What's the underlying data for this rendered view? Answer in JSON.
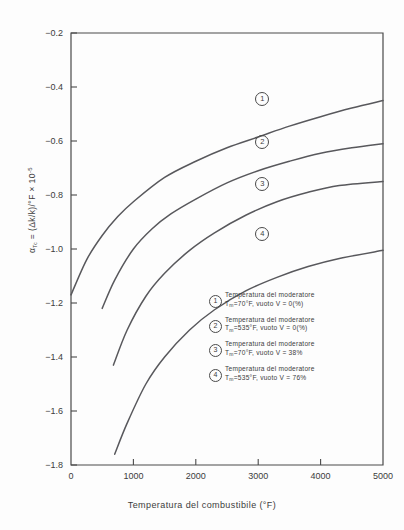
{
  "chart_data": {
    "type": "line",
    "title": "",
    "xlabel": "Temperatura del combustibile (°F)",
    "ylabel": "α_Tc = (Δk/k)/°F × 10⁻⁵",
    "xlim": [
      0,
      5000
    ],
    "ylim": [
      -1.8,
      -0.2
    ],
    "xticks": [
      "0",
      "1000",
      "2000",
      "3000",
      "4000",
      "5000"
    ],
    "yticks": [
      "-0.2",
      "-0.4",
      "-0.6",
      "-0.8",
      "-1.0",
      "-1.2",
      "-1.4",
      "-1.6",
      "-1.8"
    ],
    "grid": false,
    "legend_position": "inside-lower-right",
    "series": [
      {
        "name": "1",
        "label_line1": "Temperatura del moderatore",
        "label_line2": "T",
        "label_sub": "m",
        "label_line2b": "=70°F, vuoto V = 0(%)",
        "x": [
          0,
          250,
          500,
          750,
          1000,
          1500,
          2000,
          2500,
          3000,
          3500,
          4000,
          4500,
          5000
        ],
        "y": [
          -1.17,
          -1.04,
          -0.95,
          -0.88,
          -0.825,
          -0.735,
          -0.675,
          -0.625,
          -0.585,
          -0.545,
          -0.51,
          -0.478,
          -0.45
        ]
      },
      {
        "name": "2",
        "label_line1": "Temperatura del moderatore",
        "label_line2": "T",
        "label_sub": "m",
        "label_line2b": "=535°F, vuoto V = 0(%)",
        "x": [
          500,
          700,
          1000,
          1300,
          1600,
          2000,
          2500,
          3000,
          3500,
          4000,
          4500,
          5000
        ],
        "y": [
          -1.22,
          -1.115,
          -1.0,
          -0.925,
          -0.87,
          -0.815,
          -0.755,
          -0.71,
          -0.675,
          -0.645,
          -0.625,
          -0.61
        ]
      },
      {
        "name": "3",
        "label_line1": "Temperatura del moderatore",
        "label_line2": "T",
        "label_sub": "m",
        "label_line2b": "=70°F, vuoto V = 38%",
        "x": [
          680,
          900,
          1200,
          1500,
          1900,
          2300,
          2800,
          3300,
          3800,
          4300,
          5000
        ],
        "y": [
          -1.43,
          -1.3,
          -1.175,
          -1.09,
          -1.005,
          -0.94,
          -0.875,
          -0.825,
          -0.79,
          -0.765,
          -0.75
        ]
      },
      {
        "name": "4",
        "label_line1": "Temperatura del moderatore",
        "label_line2": "T",
        "label_sub": "m",
        "label_line2b": "=535°F, vuoto V = 76%",
        "x": [
          700,
          900,
          1200,
          1500,
          1900,
          2300,
          2800,
          3300,
          3800,
          4300,
          5000
        ],
        "y": [
          -1.76,
          -1.645,
          -1.5,
          -1.4,
          -1.3,
          -1.225,
          -1.155,
          -1.105,
          -1.065,
          -1.035,
          -1.005
        ]
      }
    ],
    "curve_markers": [
      {
        "name": "1",
        "x": 3050,
        "y": -0.44
      },
      {
        "name": "2",
        "x": 3050,
        "y": -0.6
      },
      {
        "name": "3",
        "x": 3050,
        "y": -0.755
      },
      {
        "name": "4",
        "x": 3050,
        "y": -0.94
      }
    ]
  },
  "axis": {
    "y_label_prefix": "α",
    "y_label_sub": "Tc",
    "y_label_rest": " = (Δk/k)/°F × 10",
    "y_label_exp": "-5",
    "x_label": "Temperatura del combustibile (°F)"
  },
  "ticks": {
    "x": [
      "0",
      "1000",
      "2000",
      "3000",
      "4000",
      "5000"
    ],
    "y": [
      "-0.2",
      "-0.4",
      "-0.6",
      "-0.8",
      "-1.0",
      "-1.2",
      "-1.4",
      "-1.6",
      "-1.8"
    ]
  },
  "legend": {
    "items": [
      {
        "num": "1",
        "line1": "Temperatura del moderatore",
        "line2_pre": "T",
        "line2_sub": "m",
        "line2_post": "=70°F, vuoto V = 0(%)"
      },
      {
        "num": "2",
        "line1": "Temperatura del moderatore",
        "line2_pre": "T",
        "line2_sub": "m",
        "line2_post": "=535°F, vuoto V = 0(%)"
      },
      {
        "num": "3",
        "line1": "Temperatura del moderatore",
        "line2_pre": "T",
        "line2_sub": "m",
        "line2_post": "=70°F, vuoto V = 38%"
      },
      {
        "num": "4",
        "line1": "Temperatura del moderatore",
        "line2_pre": "T",
        "line2_sub": "m",
        "line2_post": "=535°F, vuoto V = 76%"
      }
    ]
  },
  "markers": [
    {
      "num": "1"
    },
    {
      "num": "2"
    },
    {
      "num": "3"
    },
    {
      "num": "4"
    }
  ]
}
